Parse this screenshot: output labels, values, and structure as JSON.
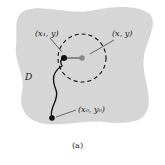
{
  "diagram": {
    "region_label": "D",
    "points": {
      "center": "(x, y)",
      "left_point": "(x₁, y)",
      "start_point": "(x₀, y₀)"
    },
    "caption": "(a)",
    "colors": {
      "region_fill": "#d6d6d6",
      "stroke": "#111111",
      "center_point": "#888888"
    }
  }
}
